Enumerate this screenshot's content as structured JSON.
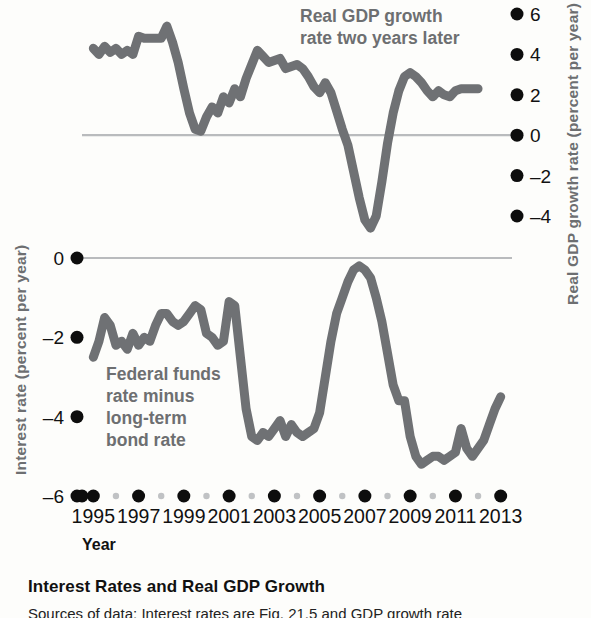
{
  "figure": {
    "caption_title": "Interest Rates and Real GDP Growth",
    "caption_subline": "Sources of data: Interest rates are Fig. 21.5 and GDP growth rate"
  },
  "axes": {
    "left_title": "Interest rate (percent per year)",
    "right_title": "Real GDP growth rate (percent per year)",
    "x_title": "Year"
  },
  "annotations": {
    "gdp_line1": "Real GDP growth",
    "gdp_line2": "rate two years later",
    "ffr_line1": "Federal funds",
    "ffr_line2": "rate minus",
    "ffr_line3": "long-term",
    "ffr_line4": "bond rate"
  },
  "colors": {
    "series": "#6f7174",
    "zero_line": "#b9bbbd",
    "tick_major": "#0d0d0d",
    "tick_minor": "#c0c2c4",
    "label_gray": "#6d6f71",
    "background": "#fdfdfb"
  },
  "chart_data": {
    "type": "line",
    "title": "Interest Rates and Real GDP Growth",
    "xlabel": "Year",
    "grid": false,
    "legend": "annotations on plot",
    "xlim": [
      1994.5,
      2013.5
    ],
    "x_ticks_major": [
      1995,
      1997,
      1999,
      2001,
      2003,
      2005,
      2007,
      2009,
      2011,
      2013
    ],
    "x_ticks_minor": [
      1996,
      1998,
      2000,
      2002,
      2004,
      2006,
      2008,
      2010,
      2012
    ],
    "panels": [
      {
        "name": "top",
        "ylabel": "Real GDP growth rate (percent per year)",
        "ylabel_side": "right",
        "ylim": [
          -5,
          6.6
        ],
        "yticks": [
          6,
          4,
          2,
          0,
          -2,
          -4
        ],
        "ytick_labels": [
          "6",
          "4",
          "2",
          "0",
          "-2",
          "-4"
        ],
        "series": [
          {
            "name": "Real GDP growth rate two years later",
            "x": [
              1995.0,
              1995.25,
              1995.5,
              1995.75,
              1996.0,
              1996.25,
              1996.5,
              1996.75,
              1997.0,
              1997.25,
              1997.5,
              1997.75,
              1998.0,
              1998.25,
              1998.5,
              1998.75,
              1999.0,
              1999.25,
              1999.5,
              1999.75,
              2000.0,
              2000.25,
              2000.5,
              2000.75,
              2001.0,
              2001.25,
              2001.5,
              2001.75,
              2002.0,
              2002.25,
              2002.5,
              2002.75,
              2003.0,
              2003.25,
              2003.5,
              2003.75,
              2004.0,
              2004.25,
              2004.5,
              2004.75,
              2005.0,
              2005.25,
              2005.5,
              2005.75,
              2006.0,
              2006.25,
              2006.5,
              2006.75,
              2007.0,
              2007.25,
              2007.5,
              2007.75,
              2008.0,
              2008.25,
              2008.5,
              2008.75,
              2009.0,
              2009.25,
              2009.5,
              2009.75,
              2010.0,
              2010.25,
              2010.5,
              2010.75,
              2011.0,
              2011.25,
              2011.5,
              2011.75,
              2012.0
            ],
            "y": [
              4.3,
              4.0,
              4.4,
              4.1,
              4.3,
              4.0,
              4.2,
              4.0,
              4.9,
              4.8,
              4.8,
              4.8,
              4.8,
              5.4,
              4.6,
              3.6,
              2.3,
              1.1,
              0.3,
              0.2,
              0.9,
              1.4,
              1.1,
              1.9,
              1.6,
              2.3,
              1.9,
              2.8,
              3.5,
              4.2,
              3.9,
              3.6,
              3.7,
              3.8,
              3.3,
              3.4,
              3.5,
              3.3,
              2.9,
              2.4,
              2.1,
              2.6,
              2.1,
              1.2,
              0.3,
              -0.5,
              -1.8,
              -3.1,
              -4.2,
              -4.6,
              -4.0,
              -2.3,
              -0.4,
              1.1,
              2.2,
              2.9,
              3.1,
              2.9,
              2.6,
              2.2,
              1.9,
              2.2,
              2.0,
              1.9,
              2.2,
              2.3,
              2.3,
              2.3,
              2.3
            ]
          }
        ]
      },
      {
        "name": "bottom",
        "ylabel": "Interest rate (percent per year)",
        "ylabel_side": "left",
        "ylim": [
          -6.4,
          0.6
        ],
        "yticks": [
          0,
          -2,
          -4,
          -6
        ],
        "ytick_labels": [
          "0",
          "-2",
          "-4",
          "-6"
        ],
        "series": [
          {
            "name": "Federal funds rate minus long-term bond rate",
            "x": [
              1995.0,
              1995.25,
              1995.5,
              1995.75,
              1996.0,
              1996.25,
              1996.5,
              1996.75,
              1997.0,
              1997.25,
              1997.5,
              1997.75,
              1998.0,
              1998.25,
              1998.5,
              1998.75,
              1999.0,
              1999.25,
              1999.5,
              1999.75,
              2000.0,
              2000.25,
              2000.5,
              2000.75,
              2001.0,
              2001.25,
              2001.5,
              2001.75,
              2002.0,
              2002.25,
              2002.5,
              2002.75,
              2003.0,
              2003.25,
              2003.5,
              2003.75,
              2004.0,
              2004.25,
              2004.5,
              2004.75,
              2005.0,
              2005.25,
              2005.5,
              2005.75,
              2006.0,
              2006.25,
              2006.5,
              2006.75,
              2007.0,
              2007.25,
              2007.5,
              2007.75,
              2008.0,
              2008.25,
              2008.5,
              2008.75,
              2009.0,
              2009.25,
              2009.5,
              2009.75,
              2010.0,
              2010.25,
              2010.5,
              2010.75,
              2011.0,
              2011.25,
              2011.5,
              2011.75,
              2012.0,
              2012.25,
              2012.5,
              2012.75,
              2013.0
            ],
            "y": [
              -2.5,
              -2.1,
              -1.5,
              -1.7,
              -2.2,
              -2.1,
              -2.3,
              -1.9,
              -2.2,
              -2.0,
              -2.1,
              -1.7,
              -1.4,
              -1.4,
              -1.6,
              -1.7,
              -1.6,
              -1.4,
              -1.2,
              -1.3,
              -1.9,
              -2.0,
              -2.2,
              -2.1,
              -1.1,
              -1.2,
              -2.5,
              -3.8,
              -4.5,
              -4.6,
              -4.4,
              -4.5,
              -4.3,
              -4.1,
              -4.5,
              -4.2,
              -4.4,
              -4.5,
              -4.4,
              -4.3,
              -3.9,
              -3.0,
              -2.1,
              -1.4,
              -1.0,
              -0.6,
              -0.3,
              -0.2,
              -0.3,
              -0.5,
              -1.0,
              -1.6,
              -2.4,
              -3.2,
              -3.6,
              -3.6,
              -4.5,
              -5.0,
              -5.2,
              -5.1,
              -5.0,
              -5.0,
              -5.1,
              -5.0,
              -4.9,
              -4.3,
              -4.8,
              -5.0,
              -4.8,
              -4.6,
              -4.2,
              -3.8,
              -3.5
            ]
          }
        ]
      }
    ]
  }
}
